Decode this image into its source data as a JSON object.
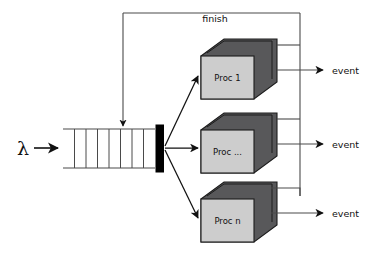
{
  "diagram": {
    "type": "queueing-system-flow-diagram",
    "background_color": "#ffffff",
    "line_color": "#3a3a3a",
    "text_color": "#111111",
    "arrival": {
      "symbol": "λ",
      "name": "arrival-rate-lambda",
      "arrow": "right"
    },
    "queue": {
      "name": "fifo-queue",
      "cell_count": 8,
      "open_ends": true,
      "fill_color": "#ffffff",
      "border_color": "#4a4a4a"
    },
    "server_bar": {
      "name": "server-dispatch-bar",
      "fill_color": "#000000"
    },
    "feedback": {
      "label": "finish",
      "name": "finish-feedback-loop",
      "direction": "processors-to-queue"
    },
    "processors": [
      {
        "label": "Proc 1",
        "name": "processor-1",
        "front_color": "#cdcdcd",
        "top_color": "#58585a",
        "side_color": "#58585a",
        "output_label": "event"
      },
      {
        "label": "Proc ...",
        "name": "processor-ellipsis",
        "front_color": "#cdcdcd",
        "top_color": "#58585a",
        "side_color": "#58585a",
        "output_label": "event"
      },
      {
        "label": "Proc n",
        "name": "processor-n",
        "front_color": "#cdcdcd",
        "top_color": "#58585a",
        "side_color": "#58585a",
        "output_label": "event"
      }
    ],
    "outputs": [
      {
        "label": "event",
        "name": "event-output-1"
      },
      {
        "label": "event",
        "name": "event-output-2"
      },
      {
        "label": "event",
        "name": "event-output-3"
      }
    ]
  }
}
